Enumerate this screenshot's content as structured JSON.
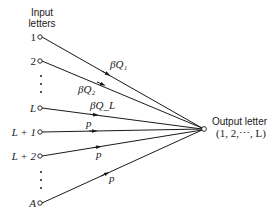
{
  "diagram": {
    "input_header": [
      "Input",
      "letters"
    ],
    "output_header": "Output letter",
    "output_range": "(1, 2,⋯, L)",
    "inputs": [
      {
        "label": "1",
        "y": 37,
        "italic": false
      },
      {
        "label": "2",
        "y": 61,
        "italic": false
      },
      {
        "label": "L",
        "y": 108,
        "italic": true
      },
      {
        "label": "L + 1",
        "y": 132,
        "italic": true
      },
      {
        "label": "L + 2",
        "y": 156,
        "italic": true
      },
      {
        "label": "A",
        "y": 203,
        "italic": true
      }
    ],
    "edges": [
      {
        "from": "1",
        "label": "βQ₁"
      },
      {
        "from": "2",
        "label": "βQ₂"
      },
      {
        "from": "L",
        "label": "βQ_L"
      },
      {
        "from": "L + 1",
        "label": "p"
      },
      {
        "from": "L + 2",
        "label": "p"
      },
      {
        "from": "A",
        "label": "p"
      }
    ],
    "ellipsis_groups": 2,
    "colors": {
      "line": "#1a1a1a",
      "node_fill": "#ffffff"
    }
  }
}
